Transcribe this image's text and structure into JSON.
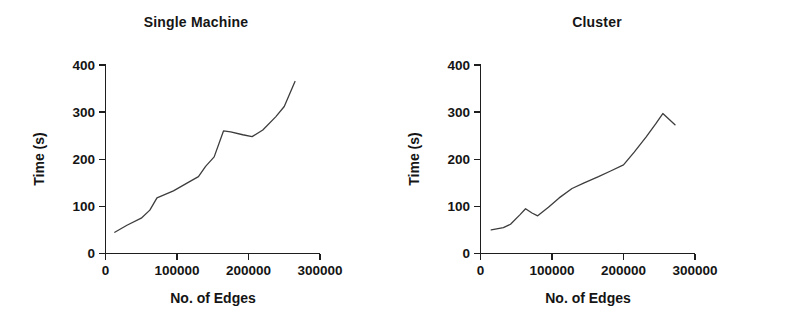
{
  "figure": {
    "panel_count": 2,
    "background_color": "#ffffff",
    "line_color": "#3d3d3d",
    "axis_color": "#1e1e1e",
    "text_color": "#141414"
  },
  "chart_data": [
    {
      "type": "line",
      "title": "Single Machine",
      "xlabel": "No. of Edges",
      "ylabel": "Time (s)",
      "xlim": [
        0,
        300000
      ],
      "ylim": [
        0,
        400
      ],
      "xticks": [
        0,
        100000,
        200000,
        300000
      ],
      "xtick_labels": [
        "0",
        "100000",
        "200000",
        "300000"
      ],
      "yticks": [
        0,
        100,
        200,
        300,
        400
      ],
      "ytick_labels": [
        "0",
        "100",
        "200",
        "300",
        "400"
      ],
      "grid": false,
      "legend": null,
      "series": [
        {
          "name": "Single Machine",
          "x": [
            13000,
            30000,
            50000,
            62000,
            72000,
            95000,
            117000,
            130000,
            140000,
            152000,
            165000,
            175000,
            192000,
            205000,
            220000,
            238000,
            250000,
            265000
          ],
          "y": [
            45,
            60,
            75,
            92,
            118,
            133,
            152,
            163,
            185,
            205,
            260,
            258,
            252,
            248,
            262,
            290,
            312,
            365
          ]
        }
      ]
    },
    {
      "type": "line",
      "title": "Cluster",
      "xlabel": "No. of Edges",
      "ylabel": "Time (s)",
      "xlim": [
        0,
        300000
      ],
      "ylim": [
        0,
        400
      ],
      "xticks": [
        0,
        100000,
        200000,
        300000
      ],
      "xtick_labels": [
        "0",
        "100000",
        "200000",
        "300000"
      ],
      "yticks": [
        0,
        100,
        200,
        300,
        400
      ],
      "ytick_labels": [
        "0",
        "100",
        "200",
        "300",
        "400"
      ],
      "grid": false,
      "legend": null,
      "series": [
        {
          "name": "Cluster",
          "x": [
            15000,
            32000,
            42000,
            55000,
            63000,
            72000,
            80000,
            95000,
            110000,
            128000,
            145000,
            165000,
            182000,
            200000,
            215000,
            232000,
            245000,
            255000,
            272000
          ],
          "y": [
            50,
            55,
            62,
            82,
            95,
            86,
            80,
            98,
            118,
            138,
            150,
            163,
            175,
            188,
            215,
            248,
            275,
            297,
            273
          ]
        }
      ]
    }
  ]
}
